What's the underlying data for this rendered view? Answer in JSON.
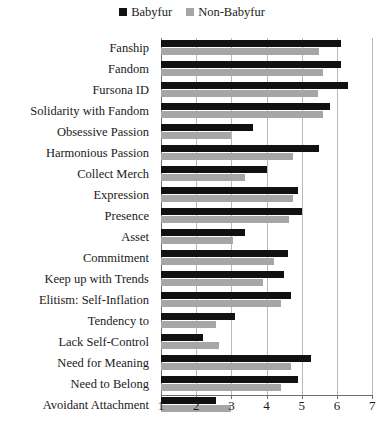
{
  "legend": {
    "entries": [
      {
        "label": "Babyfur",
        "color": "#111111",
        "swatch": "square-marker-icon"
      },
      {
        "label": "Non-Babyfur",
        "color": "#a6a6a6",
        "swatch": "square-marker-icon"
      }
    ]
  },
  "axis": {
    "ticks": [
      "1",
      "2",
      "3",
      "4",
      "5",
      "6",
      "7"
    ]
  },
  "chart_data": {
    "type": "bar",
    "orientation": "horizontal",
    "title": "",
    "subtitle": "",
    "xlabel": "",
    "ylabel": "",
    "xlim": [
      1,
      7
    ],
    "grid": true,
    "legend_position": "top-center",
    "categories": [
      "Fanship",
      "Fandom",
      "Fursona ID",
      "Solidarity with Fandom",
      "Obsessive Passion",
      "Harmonious Passion",
      "Collect Merch",
      "Expression",
      "Presence",
      "Asset",
      "Commitment",
      "Keep up with Trends",
      "Elitism: Self-Inflation",
      "Tendency to",
      "Lack Self-Control",
      "Need for Meaning",
      "Need to Belong",
      "Avoidant Attachment"
    ],
    "series": [
      {
        "name": "Babyfur",
        "color": "#111111",
        "values": [
          6.1,
          6.1,
          6.3,
          5.8,
          3.6,
          5.5,
          4.0,
          4.9,
          5.0,
          3.4,
          4.6,
          4.5,
          4.7,
          3.1,
          2.2,
          5.25,
          4.9,
          2.55
        ]
      },
      {
        "name": "Non-Babyfur",
        "color": "#a6a6a6",
        "values": [
          5.5,
          5.6,
          5.45,
          5.6,
          3.0,
          4.75,
          3.4,
          4.75,
          4.65,
          3.05,
          4.2,
          3.9,
          4.4,
          2.55,
          2.65,
          4.7,
          4.4,
          3.0
        ]
      }
    ]
  }
}
